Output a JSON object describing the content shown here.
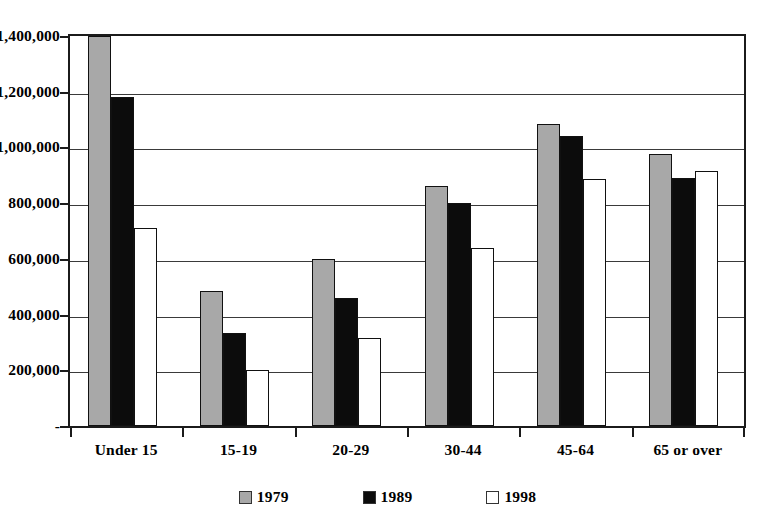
{
  "chart_data": {
    "type": "bar",
    "title": "",
    "subtitle": "",
    "xlabel": "",
    "ylabel": "",
    "categories": [
      "Under 15",
      "15-19",
      "20-29",
      "30-44",
      "45-64",
      "65 or over"
    ],
    "series": [
      {
        "name": "1979",
        "color": "#a8a8a8",
        "values": [
          1400000,
          485000,
          600000,
          860000,
          1085000,
          975000
        ]
      },
      {
        "name": "1989",
        "color": "#0c0c0c",
        "values": [
          1180000,
          335000,
          460000,
          800000,
          1040000,
          890000
        ]
      },
      {
        "name": "1998",
        "color": "#ffffff",
        "values": [
          710000,
          200000,
          315000,
          640000,
          885000,
          915000
        ]
      }
    ],
    "ylim": [
      0,
      1400000
    ],
    "yticks": [
      0,
      200000,
      400000,
      600000,
      800000,
      1000000,
      1200000,
      1400000
    ],
    "ytick_labels": [
      "-",
      "200,000",
      "400,000",
      "600,000",
      "800,000",
      "1,000,000",
      "1,200,000",
      "1,400,000"
    ],
    "grid": true,
    "grid_axis": "y",
    "legend_position": "bottom-center"
  }
}
